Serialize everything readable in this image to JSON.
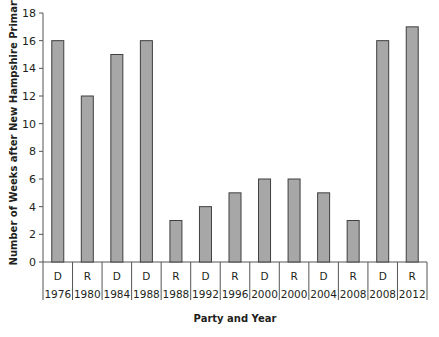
{
  "chart_data": {
    "type": "bar",
    "title": "",
    "xlabel": "Party and Year",
    "ylabel": "Number of Weeks after New Hampshire Primary",
    "ylim": [
      0,
      18
    ],
    "yticks": [
      0,
      2,
      4,
      6,
      8,
      10,
      12,
      14,
      16,
      18
    ],
    "grid": false,
    "legend": null,
    "categories": [
      {
        "party": "D",
        "year": "1976"
      },
      {
        "party": "R",
        "year": "1980"
      },
      {
        "party": "D",
        "year": "1984"
      },
      {
        "party": "D",
        "year": "1988"
      },
      {
        "party": "R",
        "year": "1988"
      },
      {
        "party": "D",
        "year": "1992"
      },
      {
        "party": "R",
        "year": "1996"
      },
      {
        "party": "D",
        "year": "2000"
      },
      {
        "party": "R",
        "year": "2000"
      },
      {
        "party": "D",
        "year": "2004"
      },
      {
        "party": "R",
        "year": "2008"
      },
      {
        "party": "D",
        "year": "2008"
      },
      {
        "party": "R",
        "year": "2012"
      }
    ],
    "values": [
      16,
      12,
      15,
      16,
      3,
      4,
      5,
      6,
      6,
      5,
      3,
      16,
      17
    ],
    "colors": {
      "bar_fill": "#a7a7a7",
      "bar_stroke": "#3f3f3f",
      "axis": "#555555"
    }
  }
}
